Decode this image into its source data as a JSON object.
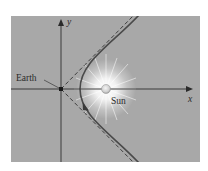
{
  "diagram": {
    "type": "hyperbolic-orbit",
    "background_color": "#a8a8a8",
    "axis_color": "#3a3a3a",
    "orbit_color": "#4a4a4a",
    "labels": {
      "x_axis": "x",
      "y_axis": "y",
      "earth": "Earth",
      "sun": "Sun"
    },
    "elements": [
      {
        "name": "x-axis",
        "kind": "arrow-axis"
      },
      {
        "name": "y-axis",
        "kind": "arrow-axis"
      },
      {
        "name": "earth",
        "kind": "point",
        "position": "origin"
      },
      {
        "name": "sun",
        "kind": "glowing-body",
        "position": "on positive x-axis (focus)"
      },
      {
        "name": "orbit",
        "kind": "hyperbola branch",
        "direction": "arrow pointing upward along lower branch"
      },
      {
        "name": "asymptotes",
        "kind": "dashed lines",
        "count": 2,
        "through": "origin"
      }
    ]
  }
}
